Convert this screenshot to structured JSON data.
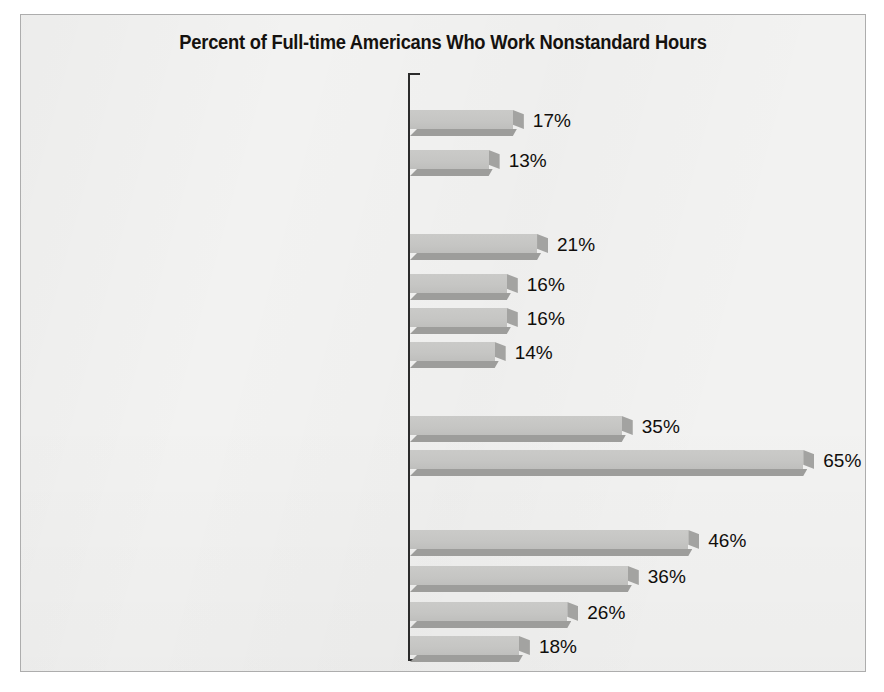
{
  "figure": {
    "title": "Percent of Full-time Americans Who Work Nonstandard Hours",
    "frame_color": "#adadad",
    "background_color": "#f2f2f1",
    "bar_face_color": "#c6c6c4",
    "bar_shadow_color": "#9d9d9b",
    "axis_color": "#2b2b2b"
  },
  "chart_data": {
    "type": "bar",
    "orientation": "horizontal",
    "title": "Percent of Full-time Americans Who Work Nonstandard Hours",
    "xlabel": "",
    "ylabel": "",
    "xlim": [
      0,
      65
    ],
    "grid": false,
    "legend": false,
    "value_suffix": "%",
    "groups": [
      {
        "name": "Sex",
        "categories": [
          "Men",
          "Women"
        ],
        "values": [
          17,
          13
        ],
        "labels": [
          "17%",
          "13%"
        ]
      },
      {
        "name": "Ethnicity",
        "categories": [
          "Black",
          "Latino",
          "Asian",
          "White"
        ],
        "values": [
          21,
          16,
          16,
          14
        ],
        "labels": [
          "21%",
          "16%",
          "16%",
          "14%"
        ]
      },
      {
        "name": "Presence of children under age 18",
        "name_bold_part": "Presence of children under age",
        "name_light_part": "18",
        "categories": [
          "One or more",
          "None"
        ],
        "values": [
          35,
          65
        ],
        "labels": [
          "35%",
          "65%"
        ]
      },
      {
        "name": "Occupation",
        "categories": [
          "Leisure and Hospitality",
          "Service",
          "Manufacturing and Transportation",
          "Managerial and Professional"
        ],
        "values": [
          46,
          36,
          26,
          18
        ],
        "labels": [
          "46%",
          "36%",
          "26%",
          "18%"
        ]
      }
    ],
    "categories": [
      "Men",
      "Women",
      "Black",
      "Latino",
      "Asian",
      "White",
      "One or more",
      "None",
      "Leisure and Hospitality",
      "Service",
      "Manufacturing and Transportation",
      "Managerial and Professional"
    ],
    "values": [
      17,
      13,
      21,
      16,
      16,
      14,
      35,
      65,
      46,
      36,
      26,
      18
    ]
  },
  "rows": [
    {
      "kind": "group",
      "label": "Sex",
      "top": 62
    },
    {
      "kind": "bar",
      "label": "Men",
      "value": 17,
      "text": "17%",
      "top": 92
    },
    {
      "kind": "bar",
      "label": "Women",
      "value": 13,
      "text": "13%",
      "top": 132
    },
    {
      "kind": "group",
      "label": "Ethnicity",
      "top": 186
    },
    {
      "kind": "bar",
      "label": "Black",
      "value": 21,
      "text": "21%",
      "top": 216
    },
    {
      "kind": "bar",
      "label": "Latino",
      "value": 16,
      "text": "16%",
      "top": 256
    },
    {
      "kind": "bar",
      "label": "Asian",
      "value": 16,
      "text": "16%",
      "top": 290
    },
    {
      "kind": "bar",
      "label": "White",
      "value": 14,
      "text": "14%",
      "top": 324
    },
    {
      "kind": "group",
      "label": "Presence of children under age 18",
      "bold": "Presence of children under age ",
      "light": "18",
      "top": 362
    },
    {
      "kind": "bar",
      "label": "One or more",
      "value": 35,
      "text": "35%",
      "top": 398
    },
    {
      "kind": "bar",
      "label": "None",
      "value": 65,
      "text": "65%",
      "top": 432
    },
    {
      "kind": "group",
      "label": "Occupation",
      "top": 478
    },
    {
      "kind": "bar",
      "label": "Leisure and Hospitality",
      "value": 46,
      "text": "46%",
      "top": 512
    },
    {
      "kind": "bar",
      "label": "Service",
      "value": 36,
      "text": "36%",
      "top": 548
    },
    {
      "kind": "bar",
      "label": "Manufacturing and Transportation",
      "value": 26,
      "text": "26%",
      "top": 584
    },
    {
      "kind": "bar",
      "label": "Managerial and Professional",
      "value": 18,
      "text": "18%",
      "top": 618
    }
  ]
}
